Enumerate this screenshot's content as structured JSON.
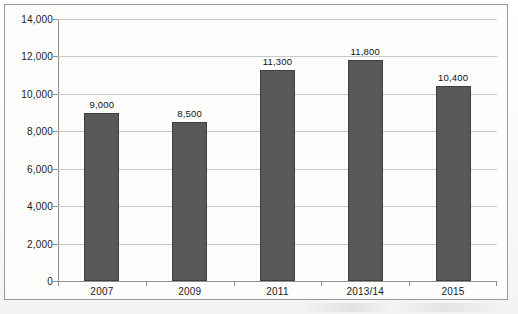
{
  "chart_data": {
    "type": "bar",
    "title": "",
    "subtitle": "",
    "xlabel": "",
    "ylabel": "",
    "categories": [
      "2007",
      "2009",
      "2011",
      "2013/14",
      "2015"
    ],
    "values": [
      9000,
      8500,
      11300,
      11800,
      10400
    ],
    "data_labels": [
      "9,000",
      "8,500",
      "11,300",
      "11,800",
      "10,400"
    ],
    "series": [
      {
        "name": "",
        "values": [
          9000,
          8500,
          11300,
          11800,
          10400
        ]
      }
    ],
    "ylim": [
      0,
      14000
    ],
    "ytick_values": [
      0,
      2000,
      4000,
      6000,
      8000,
      10000,
      12000,
      14000
    ],
    "ytick_labels": [
      "0",
      "2,000",
      "4,000",
      "6,000",
      "8,000",
      "10,000",
      "12,000",
      "14,000"
    ],
    "ytick_interval": 2000,
    "grid": true,
    "grid_axis": "y",
    "legend": false,
    "legend_position": "none",
    "bar_color": "#595959",
    "bar_border_color": "#3f3f3f",
    "grid_color": "#c9c9c9",
    "axis_color": "#8f8f8f",
    "background_color": "#fdfdfc",
    "text_color": "#1b1b1b"
  }
}
